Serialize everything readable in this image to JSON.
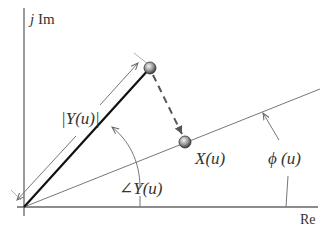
{
  "axes": {
    "imag_label_j": "j",
    "imag_label": "Im",
    "real_label": "Re"
  },
  "labels": {
    "magnitude": "|Y(u)|",
    "angle": "∠Y(u)",
    "projection": "X(u)",
    "phase": "ϕ (u)"
  },
  "colors": {
    "axis": "#555555",
    "vector": "#111111",
    "thin_line": "#777777",
    "ball": "#888888"
  }
}
